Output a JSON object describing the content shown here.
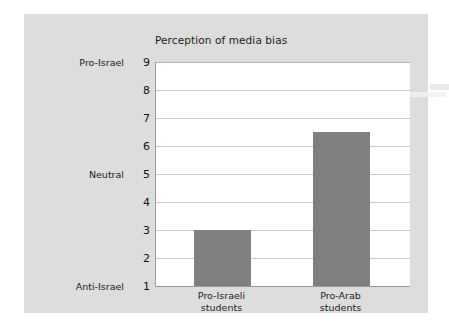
{
  "chart_data": {
    "type": "bar",
    "title": "Perception of media bias",
    "xlabel": "",
    "ylabel": "",
    "categories": [
      "Pro-Israeli students",
      "Pro-Arab students"
    ],
    "category_lines": [
      [
        "Pro-Israeli",
        "students"
      ],
      [
        "Pro-Arab",
        "students"
      ]
    ],
    "values": [
      3,
      6.5
    ],
    "ylim": [
      1,
      9
    ],
    "yticks": [
      1,
      2,
      3,
      4,
      5,
      6,
      7,
      8,
      9
    ],
    "ytick_labels": [
      "1",
      "2",
      "3",
      "4",
      "5",
      "6",
      "7",
      "8",
      "9"
    ],
    "y_category_labels": [
      {
        "value": 9,
        "label": "Pro-Israel"
      },
      {
        "value": 5,
        "label": "Neutral"
      },
      {
        "value": 1,
        "label": "Anti-Israel"
      }
    ],
    "grid": true,
    "legend": false,
    "legend_position": "none",
    "bar_color": "#808080",
    "gridline_color": "#c9c9c9",
    "axis_color": "#9a9a9a",
    "plot_background": "#ffffff",
    "panel_background": "#dddddd"
  },
  "ticks": {
    "t9": "9",
    "t8": "8",
    "t7": "7",
    "t6": "6",
    "t5": "5",
    "t4": "4",
    "t3": "3",
    "t2": "2",
    "t1": "1"
  },
  "y_categories": {
    "top": "Pro-Israel",
    "middle": "Neutral",
    "bottom": "Anti-Israel"
  },
  "x_labels": {
    "bar1_line1": "Pro-Israeli",
    "bar1_line2": "students",
    "bar2_line1": "Pro-Arab",
    "bar2_line2": "students"
  }
}
